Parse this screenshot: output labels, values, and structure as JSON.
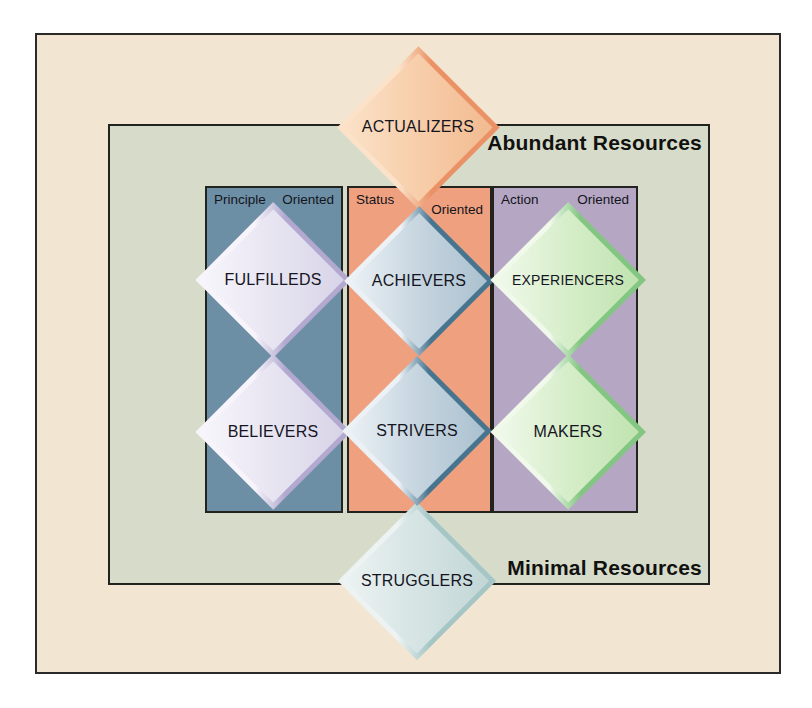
{
  "resources": {
    "abundant_label": "Abundant Resources",
    "minimal_label": "Minimal Resources"
  },
  "columns": [
    {
      "id": "principle-oriented",
      "word_left": "Principle",
      "word_right": "Oriented",
      "color": "#6c8fa6"
    },
    {
      "id": "status-oriented",
      "word_left": "Status",
      "word_right": "Oriented",
      "color": "#efa07f"
    },
    {
      "id": "action-oriented",
      "word_left": "Action",
      "word_right": "Oriented",
      "color": "#b5a7c4"
    }
  ],
  "segments": [
    {
      "id": "actualizers",
      "label": "ACTUALIZERS",
      "fill_color": "#f7cda9",
      "edge_color": "#ea9265"
    },
    {
      "id": "fulfilleds",
      "label": "FULFILLEDS",
      "fill_color": "#e7e4f1",
      "edge_color": "#b2a8d0"
    },
    {
      "id": "achievers",
      "label": "ACHIEVERS",
      "fill_color": "#c5d4df",
      "edge_color": "#47748f"
    },
    {
      "id": "experiencers",
      "label": "EXPERIENCERS",
      "fill_color": "#d5edc8",
      "edge_color": "#82c681"
    },
    {
      "id": "believers",
      "label": "BELIEVERS",
      "fill_color": "#e7e4f1",
      "edge_color": "#b2a8d0"
    },
    {
      "id": "strivers",
      "label": "STRIVERS",
      "fill_color": "#c5d4df",
      "edge_color": "#47748f"
    },
    {
      "id": "makers",
      "label": "MAKERS",
      "fill_color": "#d5edc8",
      "edge_color": "#82c681"
    },
    {
      "id": "strugglers",
      "label": "STRUGGLERS",
      "fill_color": "#d5e3e3",
      "edge_color": "#a6c6c6"
    }
  ],
  "frame_colors": {
    "outer_background": "#f2e6d2",
    "inner_background": "#d7dcca",
    "border": "#22221f"
  }
}
